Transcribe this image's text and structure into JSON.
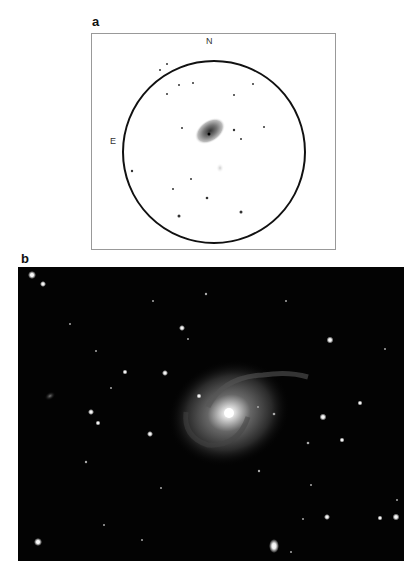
{
  "figure": {
    "panels": [
      {
        "label": "a",
        "type": "observing-sketch",
        "compass": {
          "north": "N",
          "east": "E"
        }
      },
      {
        "label": "b",
        "type": "photograph"
      }
    ]
  },
  "colors": {
    "sketch_bg": "#ffffff",
    "sketch_circle": "#111111",
    "photo_bg": "#030303"
  }
}
